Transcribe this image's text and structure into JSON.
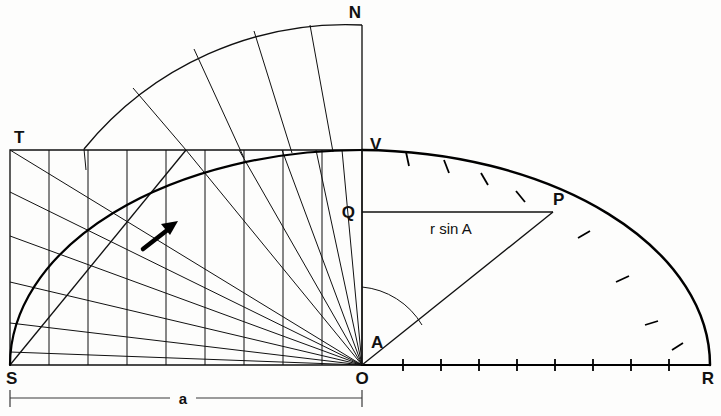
{
  "figure": {
    "kind": "geometry-diagram",
    "background_color": "#fdfdfc",
    "ink_color": "#111111"
  },
  "labels": {
    "n": "N",
    "t": "T",
    "v": "V",
    "q": "Q",
    "p": "P",
    "s": "S",
    "o": "O",
    "r": "R",
    "angle": "A",
    "chord_expr": "r sin A",
    "dimension": "a"
  },
  "geometry": {
    "origin": {
      "x": 362,
      "y": 365
    },
    "circle_radius": 348,
    "outer_radius": 350,
    "quadrant_top": {
      "x": 362,
      "y": 150
    },
    "right_end": {
      "x": 710,
      "y": 365
    },
    "point_p": {
      "x": 553,
      "y": 212
    },
    "point_q": {
      "x": 362,
      "y": 212
    },
    "point_t": {
      "x": 10,
      "y": 150
    },
    "point_s": {
      "x": 10,
      "y": 365
    },
    "point_n": {
      "x": 362,
      "y": 25
    },
    "angle_A_degrees": 52,
    "rect_columns": 9,
    "radial_lines": 11,
    "outer_band_spokes": 5,
    "arc_ticks_right": 8,
    "baseline_ticks": 8
  },
  "annotations": {
    "arrow_direction": "up-right",
    "arrow_tip": {
      "x": 176,
      "y": 223
    },
    "arrow_tail": {
      "x": 146,
      "y": 247
    }
  },
  "dimension_line": {
    "from_x": 10,
    "to_x": 362,
    "y": 398,
    "label": "a"
  }
}
